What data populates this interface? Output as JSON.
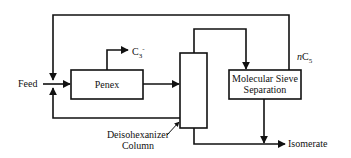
{
  "diagram": {
    "nodes": {
      "feed": {
        "label": "Feed"
      },
      "penex": {
        "label": "Penex"
      },
      "c3_offgas": {
        "label_main": "C",
        "label_sub": "3",
        "label_sup": "-"
      },
      "column": {
        "label_line1": "Deisohexanizer",
        "label_line2": "Column"
      },
      "sieve": {
        "label_line1": "Molecular Sieve",
        "label_line2": "Separation"
      },
      "nc5": {
        "label_prefix": "n",
        "label_main": "C",
        "label_sub": "5"
      },
      "isomerate": {
        "label": "Isomerate"
      }
    },
    "edges": [
      {
        "from": "feed",
        "to": "penex"
      },
      {
        "from": "penex",
        "to": "c3_offgas"
      },
      {
        "from": "penex",
        "to": "column"
      },
      {
        "from": "column",
        "to": "sieve",
        "route": "column top overhead"
      },
      {
        "from": "sieve",
        "to": "feed",
        "label": "nC5",
        "route": "top recycle"
      },
      {
        "from": "column",
        "to": "feed",
        "route": "bottom recycle"
      },
      {
        "from": "column",
        "to": "isomerate",
        "route": "column bottom"
      },
      {
        "from": "sieve",
        "to": "isomerate"
      }
    ],
    "colors": {
      "line": "#111111",
      "background": "#ffffff"
    }
  }
}
